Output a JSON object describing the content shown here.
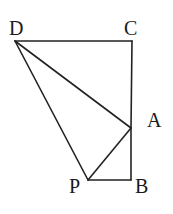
{
  "diagram": {
    "type": "geometry",
    "points": {
      "D": {
        "label": "D",
        "x": 15,
        "y": 41
      },
      "C": {
        "label": "C",
        "x": 132,
        "y": 41
      },
      "A": {
        "label": "A",
        "x": 131,
        "y": 128
      },
      "B": {
        "label": "B",
        "x": 131,
        "y": 180
      },
      "P": {
        "label": "P",
        "x": 88,
        "y": 180
      }
    },
    "segments": [
      [
        "D",
        "C"
      ],
      [
        "C",
        "A"
      ],
      [
        "A",
        "B"
      ],
      [
        "B",
        "P"
      ],
      [
        "P",
        "D"
      ],
      [
        "D",
        "A"
      ],
      [
        "A",
        "P"
      ]
    ],
    "labels": {
      "D": "D",
      "C": "C",
      "A": "A",
      "B": "B",
      "P": "P"
    },
    "colors": {
      "line": "#222222",
      "text": "#1a1a1a",
      "background": "#ffffff"
    }
  }
}
